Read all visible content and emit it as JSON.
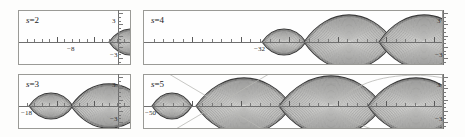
{
  "figure": {
    "kind": "contour-plot-grid",
    "rows": 2,
    "cols": 2,
    "background": "#fdfdfc",
    "axis_color": "#6f6f6f",
    "contour_color": "#3a3a3a",
    "guide_color": "#b9b9b5"
  },
  "panels": [
    {
      "id": "panel-s2",
      "label_var": "s",
      "label_eq": "=",
      "label_value": "2",
      "label": "s = 2",
      "x_min_label": "−8",
      "y_top_label": "3",
      "y_bottom_label": "−3",
      "lens_count": 2,
      "lens_centers_px": [
        112,
        155
      ],
      "lens_half_widths_px": [
        22,
        22
      ],
      "lens_half_heights_px": [
        13,
        13
      ],
      "axis_tick_count": 14
    },
    {
      "id": "panel-s3",
      "label_var": "s",
      "label_eq": "=",
      "label_value": "3",
      "label": "s = 3",
      "x_min_label": "−18",
      "y_top_label": "3",
      "y_bottom_label": "−3",
      "lens_count": 3,
      "lens_centers_px": [
        32,
        90,
        148
      ],
      "lens_half_widths_px": [
        22,
        38,
        22
      ],
      "lens_half_heights_px": [
        13,
        22,
        13
      ],
      "axis_tick_count": 14
    },
    {
      "id": "panel-s4",
      "label_var": "s",
      "label_eq": "=",
      "label_value": "4",
      "label": "s = 4",
      "x_min_label": "−32",
      "y_top_label": "3",
      "y_bottom_label": "−3",
      "lens_count": 4,
      "lens_centers_px": [
        140,
        205,
        280,
        345
      ],
      "lens_half_widths_px": [
        22,
        45,
        45,
        22
      ],
      "lens_half_heights_px": [
        13,
        27,
        27,
        13
      ],
      "axis_tick_count": 30
    },
    {
      "id": "panel-s5",
      "label_var": "s",
      "label_eq": "=",
      "label_value": "5",
      "label": "s = 5",
      "x_min_label": "−50",
      "y_top_label": "3",
      "y_bottom_label": "−3",
      "lens_count": 5,
      "lens_centers_px": [
        28,
        100,
        187,
        272,
        338
      ],
      "lens_half_widths_px": [
        20,
        48,
        52,
        48,
        22
      ],
      "lens_half_heights_px": [
        13,
        28,
        30,
        28,
        13
      ],
      "axis_tick_count": 30,
      "has_diagonal_guides": true,
      "has_ellipse_guide": true
    }
  ],
  "chart_data": {
    "type": "contour",
    "title": "",
    "xlabel": "",
    "ylabel": "",
    "panels": [
      {
        "name": "s = 2",
        "parameter": "s",
        "value": 2,
        "x_range_label": [
          "−8",
          ""
        ],
        "y_range_label": [
          "−3",
          "3"
        ],
        "ylim": [
          -3,
          3
        ],
        "n_lobes": 2
      },
      {
        "name": "s = 3",
        "parameter": "s",
        "value": 3,
        "x_range_label": [
          "−18",
          ""
        ],
        "y_range_label": [
          "−3",
          "3"
        ],
        "ylim": [
          -3,
          3
        ],
        "n_lobes": 3
      },
      {
        "name": "s = 4",
        "parameter": "s",
        "value": 4,
        "x_range_label": [
          "−32",
          ""
        ],
        "y_range_label": [
          "−3",
          "3"
        ],
        "ylim": [
          -3,
          3
        ],
        "n_lobes": 4
      },
      {
        "name": "s = 5",
        "parameter": "s",
        "value": 5,
        "x_range_label": [
          "−50",
          ""
        ],
        "y_range_label": [
          "−3",
          "3"
        ],
        "ylim": [
          -3,
          3
        ],
        "n_lobes": 5
      }
    ],
    "grid": false,
    "legend": "none"
  }
}
